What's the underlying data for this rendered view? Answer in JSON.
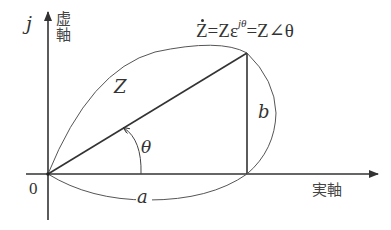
{
  "diagram": {
    "type": "complex-plane-phasor",
    "axes": {
      "imaginary": {
        "symbol": "j",
        "label": "虚軸"
      },
      "real": {
        "label": "実軸"
      },
      "origin_label": "0"
    },
    "vector": {
      "label": "Z",
      "angle_label": "θ",
      "real_component_label": "a",
      "imag_component_label": "b"
    },
    "formula": {
      "lhs": "Z",
      "eq1": "=",
      "mid_base": "Zε",
      "mid_exp": "jθ",
      "eq2": "=",
      "rhs": "Z∠θ"
    },
    "colors": {
      "line": "#333333",
      "background": "#ffffff"
    }
  }
}
